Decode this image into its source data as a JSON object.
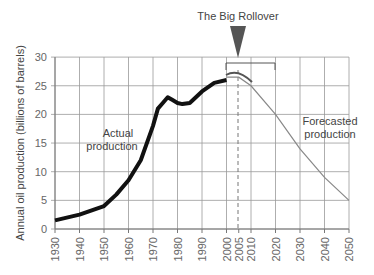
{
  "chart_data": {
    "type": "line",
    "title": "The Big Rollover",
    "xlabel": "",
    "ylabel": "Annual oil production (billions of barrels)",
    "ylim": [
      0,
      30
    ],
    "xlim": [
      1930,
      2050
    ],
    "grid": true,
    "xticks": [
      "1930",
      "1940",
      "1950",
      "1960",
      "1970",
      "1980",
      "1990",
      "2000",
      "2005",
      "2010",
      "2020",
      "2030",
      "2040",
      "2050"
    ],
    "yticks": [
      "0",
      "5",
      "10",
      "15",
      "20",
      "25",
      "30"
    ],
    "series": [
      {
        "name": "Actual production",
        "x": [
          1930,
          1940,
          1950,
          1955,
          1960,
          1965,
          1970,
          1972,
          1974,
          1976,
          1978,
          1980,
          1982,
          1985,
          1990,
          1995,
          2000
        ],
        "values": [
          1.5,
          2.5,
          4,
          6,
          8.5,
          12,
          18,
          21,
          22,
          23,
          22.5,
          22,
          21.8,
          22,
          24,
          25.5,
          26
        ]
      },
      {
        "name": "Forecasted production",
        "x": [
          2000,
          2005,
          2010,
          2020,
          2030,
          2040,
          2050
        ],
        "values": [
          26.5,
          26.5,
          25,
          20,
          14,
          9,
          5
        ]
      }
    ],
    "annotations": [
      "The Big Rollover",
      "Actual production",
      "Forecasted production"
    ]
  }
}
